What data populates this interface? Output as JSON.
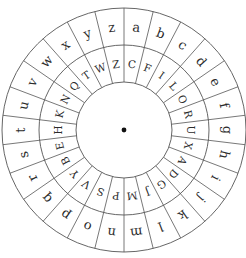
{
  "geometry": {
    "cx": 124,
    "cy": 130,
    "r_outer": 122,
    "r_middle": 85,
    "r_inner": 48,
    "segments": 26
  },
  "outer_ring": {
    "label": "plaintext alphabet",
    "letters": [
      "a",
      "b",
      "c",
      "d",
      "e",
      "f",
      "g",
      "h",
      "i",
      "j",
      "k",
      "l",
      "m",
      "n",
      "o",
      "p",
      "q",
      "r",
      "s",
      "t",
      "u",
      "v",
      "w",
      "x",
      "y",
      "z"
    ]
  },
  "inner_ring": {
    "label": "ciphertext alphabet (shift 3)",
    "letters": [
      "C",
      "F",
      "I",
      "L",
      "O",
      "R",
      "U",
      "X",
      "A",
      "D",
      "G",
      "J",
      "M",
      "P",
      "S",
      "V",
      "Y",
      "B",
      "E",
      "H",
      "K",
      "N",
      "Q",
      "T",
      "W",
      "Z"
    ]
  },
  "center": {
    "label": "pivot dot"
  },
  "colors": {
    "line": "#555555",
    "text": "#2b2b2b",
    "background": "#ffffff"
  }
}
